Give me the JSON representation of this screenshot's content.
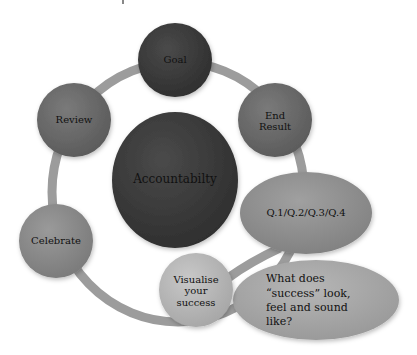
{
  "diagram": {
    "center": {
      "label": "Accountabilty"
    },
    "nodes": [
      {
        "id": "goal",
        "label": "Goal"
      },
      {
        "id": "end-result",
        "label": "End\nResult"
      },
      {
        "id": "visualise",
        "label": "Visualise\nyour\nsuccess"
      },
      {
        "id": "celebrate",
        "label": "Celebrate"
      },
      {
        "id": "review",
        "label": "Review"
      }
    ],
    "callouts": [
      {
        "id": "quarters",
        "label": "Q.1/Q.2/Q.3/Q.4"
      },
      {
        "id": "success-question",
        "label": "What does “success” look, feel and sound like?"
      }
    ],
    "colors": {
      "ring": "#9c9c9c",
      "dark": "#3b3b3b",
      "medium": "#6a6a6a",
      "celebrate": "#8a8a8a",
      "quarters": "#8f8f8f",
      "visualise": "#b8b8b8",
      "question": "#a9a9a9"
    }
  }
}
